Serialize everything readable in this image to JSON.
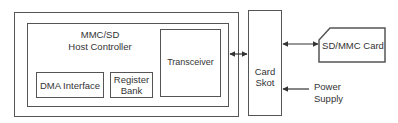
{
  "diagram": {
    "host_controller": {
      "title_line1": "MMC/SD",
      "title_line2": "Host Controller"
    },
    "dma_interface": {
      "label": "DMA Interface"
    },
    "register_bank": {
      "line1": "Register",
      "line2": "Bank"
    },
    "transceiver": {
      "label": "Transceiver"
    },
    "card_slot": {
      "line1": "Card",
      "line2": "Skot"
    },
    "sd_mmc_card": {
      "label": "SD/MMC Card"
    },
    "power_supply": {
      "line1": "Power",
      "line2": "Supply"
    },
    "connections": [
      {
        "from": "Transceiver",
        "to": "Card Skot",
        "type": "bidirectional"
      },
      {
        "from": "Card Skot",
        "to": "SD/MMC Card",
        "type": "bidirectional"
      },
      {
        "from": "Power Supply",
        "to": "Card Skot",
        "type": "unidirectional"
      }
    ],
    "line_color": "#555555"
  }
}
